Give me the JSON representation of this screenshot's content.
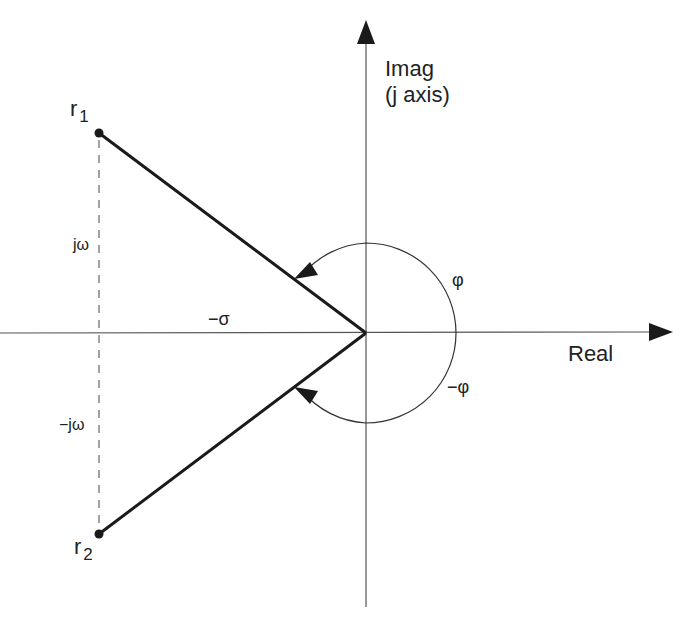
{
  "diagram": {
    "axes": {
      "imag_label_line1": "Imag",
      "imag_label_line2": "(j axis)",
      "real_label": "Real"
    },
    "points": {
      "r1_base": "r",
      "r1_sub": "1",
      "r2_base": "r",
      "r2_sub": "2"
    },
    "annotations": {
      "j_omega": "jω",
      "neg_j_omega": "−jω",
      "neg_sigma": "−σ",
      "phi": "φ",
      "neg_phi": "−φ"
    },
    "colors": {
      "stroke": "#1a1a1a",
      "axis": "#555555",
      "background": "#ffffff"
    }
  }
}
